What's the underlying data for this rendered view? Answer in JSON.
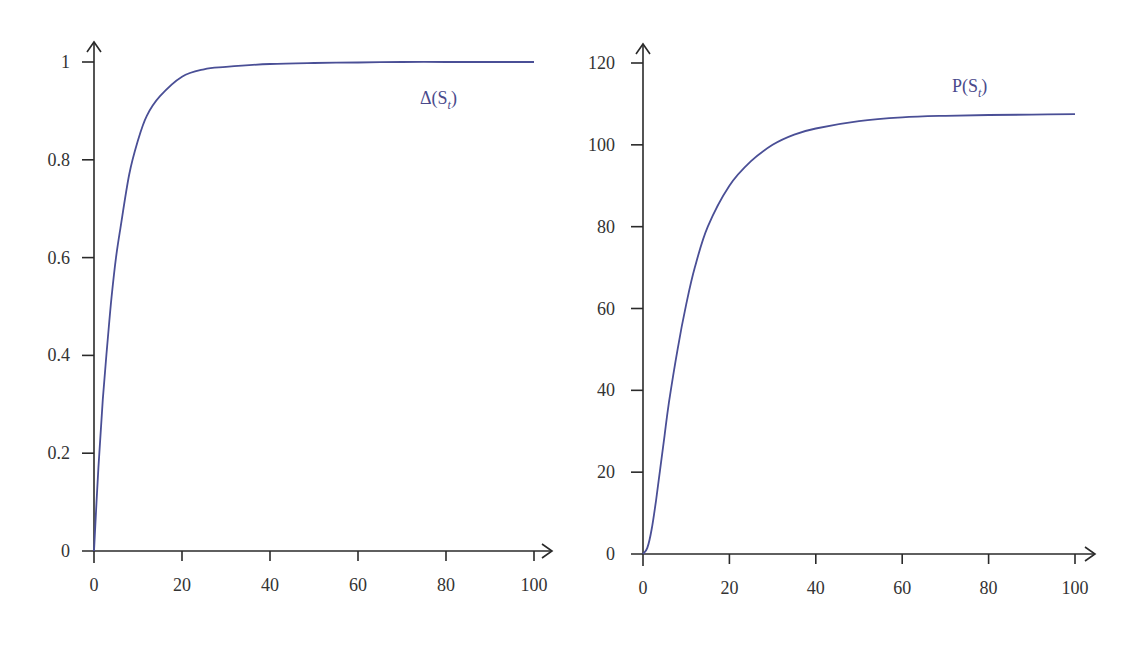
{
  "chart_data": [
    {
      "type": "line",
      "title": "",
      "xlabel": "",
      "ylabel": "",
      "xlim": [
        0,
        100
      ],
      "ylim": [
        0,
        1
      ],
      "x_ticks": [
        0,
        20,
        40,
        60,
        80,
        100
      ],
      "x_tick_labels": [
        "0",
        "20",
        "40",
        "60",
        "80",
        "100"
      ],
      "y_ticks": [
        0,
        0.2,
        0.4,
        0.6,
        0.8,
        1
      ],
      "y_tick_labels": [
        "0",
        "0.2",
        "0.4",
        "0.6",
        "0.8",
        "1"
      ],
      "grid": false,
      "series": [
        {
          "name": "Δ(S_t)",
          "label_text": "Δ(S",
          "label_sub": "t",
          "label_close": ")",
          "color": "#4a4f96",
          "x": [
            0,
            1,
            2,
            3,
            4,
            5,
            6,
            8,
            10,
            12,
            15,
            20,
            25,
            30,
            40,
            50,
            60,
            70,
            80,
            90,
            100
          ],
          "values": [
            0,
            0.17,
            0.31,
            0.42,
            0.52,
            0.6,
            0.66,
            0.77,
            0.84,
            0.89,
            0.93,
            0.97,
            0.985,
            0.99,
            0.996,
            0.998,
            0.999,
            1,
            1,
            1,
            1
          ]
        }
      ]
    },
    {
      "type": "line",
      "title": "",
      "xlabel": "",
      "ylabel": "",
      "xlim": [
        0,
        100
      ],
      "ylim": [
        0,
        120
      ],
      "x_ticks": [
        0,
        20,
        40,
        60,
        80,
        100
      ],
      "x_tick_labels": [
        "0",
        "20",
        "40",
        "60",
        "80",
        "100"
      ],
      "y_ticks": [
        0,
        20,
        40,
        60,
        80,
        100,
        120
      ],
      "y_tick_labels": [
        "0",
        "20",
        "40",
        "60",
        "80",
        "100",
        "120"
      ],
      "grid": false,
      "series": [
        {
          "name": "P(S_t)",
          "label_text": "P(S",
          "label_sub": "t",
          "label_close": ")",
          "color": "#4a4f96",
          "x": [
            0,
            1,
            2,
            3,
            4,
            5,
            6,
            8,
            10,
            12,
            15,
            20,
            25,
            30,
            35,
            40,
            50,
            60,
            70,
            80,
            90,
            100
          ],
          "values": [
            0,
            1.5,
            6,
            13,
            21,
            29,
            37,
            50,
            61,
            70,
            80,
            90,
            96,
            100,
            102.5,
            104,
            105.8,
            106.7,
            107.1,
            107.3,
            107.4,
            107.5
          ]
        }
      ]
    }
  ]
}
